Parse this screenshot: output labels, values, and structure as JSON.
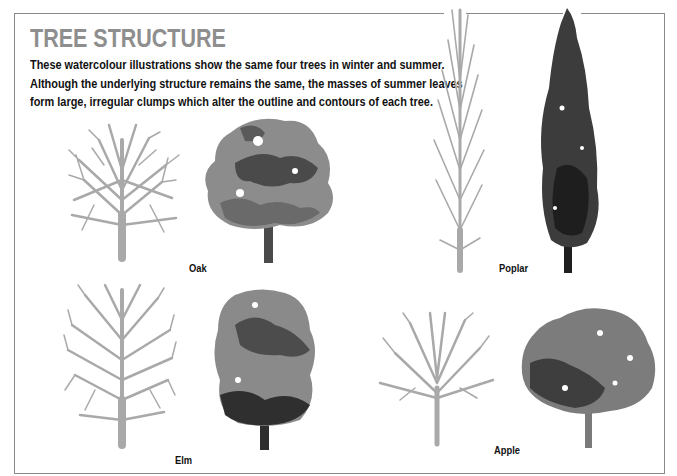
{
  "page": {
    "title": "TREE STRUCTURE",
    "intro_lines": [
      "These watercolour illustrations show the same four trees in winter and summer.",
      "Although the underlying structure remains the same, the masses of summer leaves",
      "form large, irregular clumps which alter the outline and contours of each tree."
    ]
  },
  "trees": [
    {
      "name": "Oak",
      "winter_icon": "bare-oak-tree",
      "summer_icon": "leafy-oak-tree"
    },
    {
      "name": "Poplar",
      "winter_icon": "bare-poplar-tree",
      "summer_icon": "leafy-poplar-tree"
    },
    {
      "name": "Elm",
      "winter_icon": "bare-elm-tree",
      "summer_icon": "leafy-elm-tree"
    },
    {
      "name": "Apple",
      "winter_icon": "bare-apple-tree",
      "summer_icon": "leafy-apple-tree"
    }
  ],
  "colors": {
    "title": "#8e8e8e",
    "bare_branches": "#a9a9a9",
    "foliage_light": "#8c8c8c",
    "foliage_dark": "#3a3a3a",
    "frame": "#8a8a8a"
  }
}
